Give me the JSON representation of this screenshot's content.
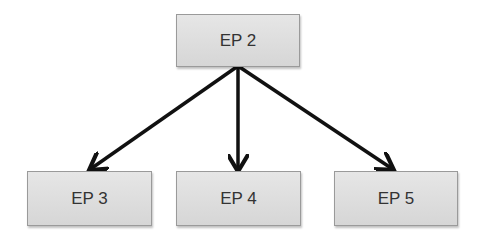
{
  "diagram": {
    "root": {
      "label": "EP 2"
    },
    "children": [
      {
        "label": "EP 3"
      },
      {
        "label": "EP 4"
      },
      {
        "label": "EP 5"
      }
    ],
    "edges": [
      {
        "from": "EP 2",
        "to": "EP 3"
      },
      {
        "from": "EP 2",
        "to": "EP 4"
      },
      {
        "from": "EP 2",
        "to": "EP 5"
      }
    ]
  }
}
